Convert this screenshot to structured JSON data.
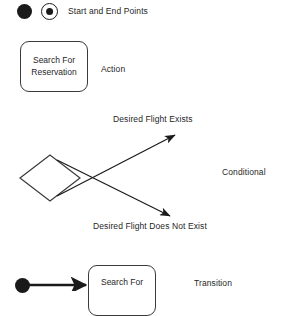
{
  "diagram": {
    "background_color": "#ffffff",
    "stroke_color": "#1a1a1a",
    "text_color": "#1f1f1f"
  },
  "legend_rows": [
    {
      "key": "start-end",
      "label": "Start and End Points",
      "symbols": [
        "start-point-filled-circle",
        "end-point-ringed-circle"
      ]
    },
    {
      "key": "action",
      "label": "Action",
      "shape_text": "Search For\nReservation"
    },
    {
      "key": "conditional",
      "label": "Conditional",
      "branch_true": "Desired Flight Exists",
      "branch_false": "Desired Flight Does Not Exist"
    },
    {
      "key": "transition",
      "label": "Transition",
      "shape_text": "Search For"
    }
  ],
  "legend": {
    "start_end_label": "Start and End Points",
    "action_label": "Action",
    "conditional_label": "Conditional",
    "transition_label": "Transition"
  },
  "shapes": {
    "action_box_text": "Search For\nReservation",
    "transition_box_text": "Search For"
  },
  "branches": {
    "true_label": "Desired Flight Exists",
    "false_label": "Desired Flight Does Not Exist"
  }
}
